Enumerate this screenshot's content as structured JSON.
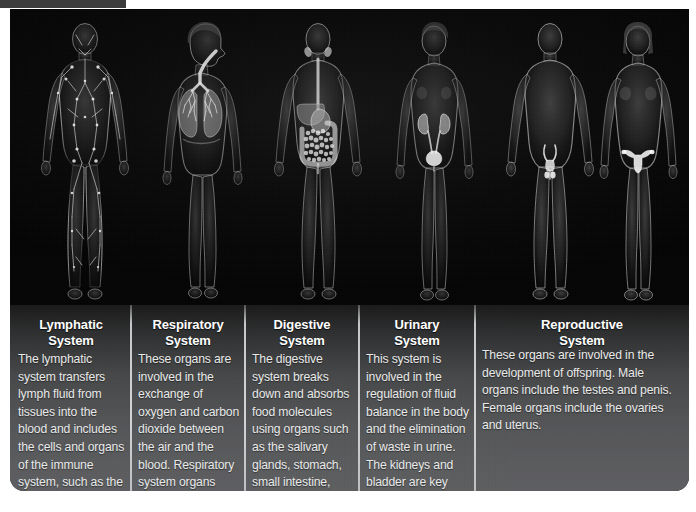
{
  "page": {
    "top_bar_color": "#3c3c3c",
    "panel_background": "#0a0a0a",
    "caption_background": "#5b5c5e",
    "title_color": "#ffffff",
    "body_text_color": "#e9eaea",
    "divider_color": "#d2d4d6"
  },
  "systems": [
    {
      "id": "lymphatic",
      "title": "Lymphatic\nSystem",
      "description": "The lymphatic system transfers lymph fluid from tissues into the blood and includes the cells and organs of the immune system, such as the lymph nodes, spleen, and bone marrow.",
      "figure_label": "lymphatic-system-figure",
      "figure_sex": "male",
      "organs": [
        "lymph vessels",
        "lymph nodes",
        "spleen",
        "bone marrow"
      ]
    },
    {
      "id": "respiratory",
      "title": "Respiratory\nSystem",
      "description": "These organs are involved in the exchange of oxygen and carbon dioxide between the air and the blood. Respiratory system organs include the trachea, lungs, and diaphragm.",
      "figure_label": "respiratory-system-figure",
      "figure_sex": "female",
      "organs": [
        "trachea",
        "lungs",
        "diaphragm"
      ]
    },
    {
      "id": "digestive",
      "title": "Digestive\nSystem",
      "description": "The digestive system breaks down and absorbs food molecules using organs such as the salivary glands, stomach, small intestine, liver, and large intestine.",
      "figure_label": "digestive-system-figure",
      "figure_sex": "male",
      "organs": [
        "salivary glands",
        "stomach",
        "small intestine",
        "liver",
        "large intestine"
      ]
    },
    {
      "id": "urinary",
      "title": "Urinary\nSystem",
      "description": "This system is involved in the regulation of fluid balance in the body and the elimination of waste in urine. The kidneys and bladder are key organs in this system.",
      "figure_label": "urinary-system-figure",
      "figure_sex": "female",
      "organs": [
        "kidneys",
        "ureters",
        "bladder"
      ]
    },
    {
      "id": "reproductive",
      "title": "Reproductive\nSystem",
      "description": "These organs are involved in the development of offspring. Male organs include the testes and penis. Female organs include the ovaries and uterus.",
      "figure_label": "reproductive-system-figure",
      "figure_sex": "male-and-female",
      "organs": [
        "testes",
        "penis",
        "ovaries",
        "uterus"
      ]
    }
  ]
}
